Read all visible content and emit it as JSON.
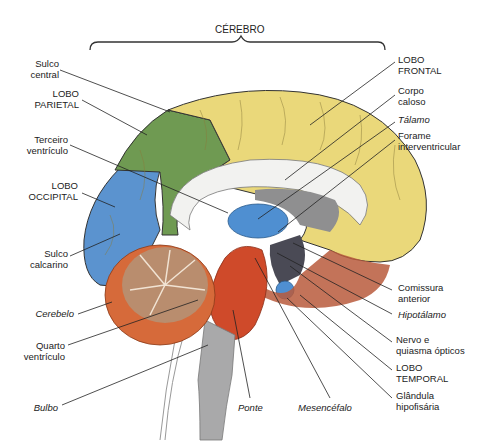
{
  "title": "CÉREBRO",
  "colors": {
    "frontal": "#ead87a",
    "parietal": "#6f9a52",
    "occipital": "#5b93cf",
    "thalamus": "#4f8fd1",
    "cerebellum": "#d66a3a",
    "arbor": "#b98d6e",
    "brainstem": "#cf4a2a",
    "bulbo": "#a9a9aa",
    "corpus_callosum": "#f2f2f0",
    "ventricle": "#8f8f90",
    "hypothalamus": "#4a4a55",
    "pituitary": "#4f8fd1",
    "outline": "#333333",
    "leader": "#222222"
  },
  "labels_left": [
    {
      "id": "sulco-central",
      "text": "Sulco\ncentral",
      "italic": false
    },
    {
      "id": "lobo-parietal",
      "text": "LOBO\nPARIETAL",
      "italic": false
    },
    {
      "id": "terceiro-ventriculo",
      "text": "Terceiro\nventrículo",
      "italic": false
    },
    {
      "id": "lobo-occipital",
      "text": "LOBO\nOCCIPITAL",
      "italic": false
    },
    {
      "id": "sulco-calcarino",
      "text": "Sulco\ncalcarino",
      "italic": false
    },
    {
      "id": "cerebelo",
      "text": "Cerebelo",
      "italic": true
    },
    {
      "id": "quarto-ventriculo",
      "text": "Quarto\nventrículo",
      "italic": false
    },
    {
      "id": "bulbo",
      "text": "Bulbo",
      "italic": true
    }
  ],
  "labels_right": [
    {
      "id": "lobo-frontal",
      "text": "LOBO\nFRONTAL",
      "italic": false
    },
    {
      "id": "corpo-caloso",
      "text": "Corpo\ncaloso",
      "italic": false
    },
    {
      "id": "talamo",
      "text": "Tálamo",
      "italic": true
    },
    {
      "id": "forame-interventricular",
      "text": "Forame\ninterventricular",
      "italic": false
    },
    {
      "id": "comissura-anterior",
      "text": "Comissura\nanterior",
      "italic": false
    },
    {
      "id": "hipotalamo",
      "text": "Hipotálamo",
      "italic": true
    },
    {
      "id": "nervo-quiasma",
      "text": "Nervo e\nquiasma ópticos",
      "italic": false
    },
    {
      "id": "lobo-temporal",
      "text": "LOBO\nTEMPORAL",
      "italic": false
    },
    {
      "id": "glandula-hipofisaria",
      "text": "Glândula\nhipofisária",
      "italic": false
    }
  ],
  "labels_bottom": [
    {
      "id": "ponte",
      "text": "Ponte",
      "italic": true
    },
    {
      "id": "mesencefalo",
      "text": "Mesencéfalo",
      "italic": true
    }
  ]
}
